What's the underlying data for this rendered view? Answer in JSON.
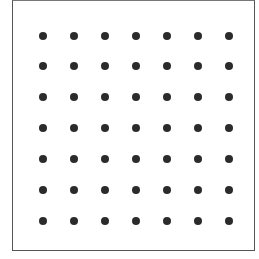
{
  "figure": {
    "rows": 7,
    "columns": 7,
    "dot_color": "#2b2b2b",
    "frame_color": "#555555",
    "x_positions": [
      43,
      74,
      105,
      136,
      167,
      198,
      229
    ],
    "y_positions": [
      36,
      66,
      97,
      128,
      159,
      190,
      221
    ],
    "dot_diameter": 8
  }
}
